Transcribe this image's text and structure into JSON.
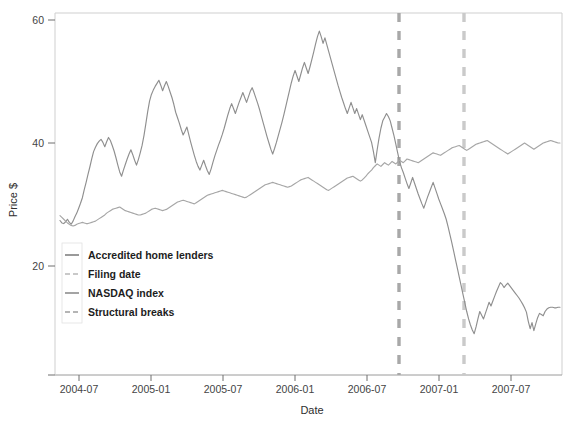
{
  "chart_data": {
    "type": "line",
    "title": "",
    "xlabel": "Date",
    "ylabel": "Price $",
    "grid": false,
    "legend_position": "inner-left",
    "x_tick_labels": [
      "2004-07",
      "2005-01",
      "2005-07",
      "2006-01",
      "2006-07",
      "2007-01",
      "2007-07"
    ],
    "y_tick_labels": [
      "20",
      "40",
      "60"
    ],
    "ylim": [
      0,
      62
    ],
    "xlim": [
      "2004-05-01",
      "2007-11-15"
    ],
    "legend": [
      {
        "label": "Accredited home lenders",
        "color": "#8f8f8f",
        "style": "solid"
      },
      {
        "label": "Filing date",
        "color": "#c9c9c9",
        "style": "dashed"
      },
      {
        "label": "NASDAQ index",
        "color": "#9a9a9a",
        "style": "solid"
      },
      {
        "label": "Structural breaks",
        "color": "#b5b5b5",
        "style": "dashed"
      }
    ],
    "vertical_lines": [
      {
        "name": "structural-break",
        "label": "Structural breaks",
        "x_label": "2006-09",
        "x_px": 399,
        "color": "#a8a8a8",
        "style": "dashed"
      },
      {
        "name": "filing-date",
        "label": "Filing date",
        "x_label": "2007-03",
        "x_px": 464,
        "color": "#cacaca",
        "style": "dashed"
      }
    ],
    "series": [
      {
        "name": "Accredited home lenders",
        "color": "#8f8f8f",
        "values": [
          27.4,
          27.0,
          26.9,
          27.2,
          27.6,
          27.1,
          26.8,
          27.3,
          28.0,
          28.6,
          29.4,
          30.2,
          31.1,
          32.4,
          33.6,
          34.9,
          36.1,
          37.4,
          38.6,
          39.3,
          39.9,
          40.3,
          40.6,
          40.1,
          39.4,
          40.2,
          40.9,
          40.4,
          39.6,
          38.7,
          37.6,
          36.4,
          35.3,
          34.6,
          35.6,
          36.5,
          37.4,
          38.2,
          38.9,
          38.1,
          37.2,
          36.4,
          37.3,
          38.4,
          39.6,
          41.2,
          43.1,
          45.1,
          46.8,
          47.9,
          48.6,
          49.2,
          49.7,
          50.2,
          49.4,
          48.5,
          49.3,
          50.0,
          49.2,
          48.3,
          47.4,
          46.3,
          45.0,
          44.1,
          43.2,
          42.2,
          41.3,
          41.9,
          42.6,
          41.4,
          40.2,
          39.1,
          38.0,
          37.0,
          36.2,
          35.6,
          36.4,
          37.2,
          36.3,
          35.5,
          34.9,
          35.8,
          36.9,
          37.9,
          38.8,
          39.7,
          40.5,
          41.4,
          42.4,
          43.5,
          44.6,
          45.6,
          46.4,
          45.6,
          44.8,
          45.7,
          46.6,
          47.4,
          48.2,
          47.4,
          46.6,
          47.5,
          48.4,
          49.0,
          48.2,
          47.3,
          46.4,
          45.4,
          44.3,
          43.2,
          42.1,
          41.0,
          40.0,
          39.0,
          38.2,
          39.1,
          40.1,
          41.2,
          42.3,
          43.4,
          44.6,
          45.9,
          47.2,
          48.5,
          49.8,
          50.9,
          51.8,
          50.9,
          50.0,
          51.1,
          52.2,
          53.1,
          52.2,
          51.3,
          52.4,
          53.6,
          54.8,
          56.1,
          57.3,
          58.2,
          57.3,
          56.2,
          57.1,
          56.0,
          54.9,
          53.8,
          52.7,
          51.6,
          50.5,
          49.4,
          48.4,
          47.4,
          46.5,
          45.6,
          44.8,
          45.7,
          46.6,
          45.7,
          44.8,
          45.6,
          44.7,
          43.8,
          44.6,
          43.7,
          42.8,
          41.9,
          41.0,
          40.1,
          38.6,
          36.8,
          38.9,
          40.8,
          42.4,
          43.6,
          44.2,
          44.8,
          44.3,
          43.6,
          42.4,
          41.2,
          39.8,
          38.4,
          37.0,
          36.0,
          35.2,
          34.3,
          33.4,
          32.6,
          33.5,
          34.4,
          33.5,
          32.6,
          31.7,
          30.9,
          30.1,
          29.4,
          30.3,
          31.2,
          32.0,
          32.8,
          33.6,
          32.7,
          31.8,
          30.9,
          30.1,
          29.3,
          28.5,
          27.6,
          26.4,
          25.1,
          23.8,
          22.4,
          21.0,
          19.6,
          18.2,
          16.8,
          15.4,
          14.0,
          12.6,
          11.4,
          10.4,
          9.6,
          9.0,
          10.1,
          11.4,
          12.6,
          12.0,
          11.4,
          12.3,
          13.2,
          14.1,
          13.5,
          14.3,
          15.1,
          15.9,
          16.6,
          17.3,
          17.0,
          16.5,
          16.9,
          17.2,
          16.8,
          16.4,
          16.0,
          15.6,
          15.2,
          14.8,
          14.3,
          13.8,
          13.2,
          12.5,
          11.0,
          9.8,
          10.8,
          9.5,
          10.6,
          11.6,
          12.3,
          12.1,
          11.9,
          12.6,
          13.0,
          13.2,
          13.3,
          13.3,
          13.2,
          13.2,
          13.3,
          13.3
        ]
      },
      {
        "name": "NASDAQ index",
        "color": "#a6a6a6",
        "values": [
          28.2,
          27.9,
          27.6,
          27.3,
          27.0,
          26.8,
          26.6,
          26.5,
          26.6,
          26.8,
          26.9,
          27.0,
          27.1,
          27.0,
          26.9,
          26.9,
          27.0,
          27.1,
          27.2,
          27.3,
          27.5,
          27.7,
          27.9,
          28.1,
          28.3,
          28.6,
          28.8,
          29.0,
          29.2,
          29.3,
          29.4,
          29.5,
          29.6,
          29.4,
          29.2,
          29.0,
          28.9,
          28.8,
          28.7,
          28.6,
          28.5,
          28.4,
          28.3,
          28.3,
          28.4,
          28.5,
          28.6,
          28.8,
          29.0,
          29.2,
          29.3,
          29.4,
          29.3,
          29.2,
          29.1,
          29.0,
          29.1,
          29.2,
          29.4,
          29.6,
          29.8,
          30.0,
          30.2,
          30.4,
          30.5,
          30.6,
          30.7,
          30.6,
          30.5,
          30.4,
          30.3,
          30.2,
          30.1,
          30.3,
          30.5,
          30.7,
          30.9,
          31.1,
          31.3,
          31.5,
          31.6,
          31.7,
          31.8,
          31.9,
          32.0,
          32.1,
          32.2,
          32.3,
          32.2,
          32.1,
          32.0,
          31.9,
          31.8,
          31.7,
          31.6,
          31.5,
          31.4,
          31.3,
          31.2,
          31.1,
          31.2,
          31.4,
          31.6,
          31.8,
          32.0,
          32.2,
          32.4,
          32.6,
          32.8,
          33.0,
          33.2,
          33.3,
          33.4,
          33.5,
          33.6,
          33.5,
          33.4,
          33.3,
          33.2,
          33.1,
          33.0,
          32.9,
          32.8,
          32.9,
          33.0,
          33.2,
          33.4,
          33.6,
          33.8,
          34.0,
          34.1,
          34.2,
          34.3,
          34.4,
          34.2,
          34.0,
          33.8,
          33.6,
          33.4,
          33.2,
          33.0,
          32.8,
          32.6,
          32.4,
          32.3,
          32.5,
          32.7,
          32.9,
          33.1,
          33.3,
          33.5,
          33.7,
          33.9,
          34.1,
          34.3,
          34.4,
          34.5,
          34.6,
          34.4,
          34.2,
          34.0,
          33.8,
          34.0,
          34.3,
          34.6,
          35.0,
          35.3,
          35.6,
          36.0,
          36.3,
          36.6,
          36.4,
          36.2,
          36.5,
          36.8,
          36.6,
          36.4,
          36.7,
          37.0,
          36.8,
          36.6,
          36.9,
          37.2,
          37.0,
          36.8,
          37.1,
          37.4,
          37.3,
          37.2,
          37.1,
          37.0,
          36.9,
          36.8,
          37.0,
          37.2,
          37.4,
          37.6,
          37.8,
          38.0,
          38.2,
          38.4,
          38.3,
          38.2,
          38.1,
          38.0,
          38.2,
          38.4,
          38.6,
          38.8,
          39.0,
          39.2,
          39.3,
          39.4,
          39.5,
          39.6,
          39.4,
          39.2,
          39.0,
          38.8,
          39.0,
          39.2,
          39.4,
          39.6,
          39.8,
          39.9,
          40.0,
          40.1,
          40.2,
          40.3,
          40.4,
          40.2,
          40.0,
          39.8,
          39.6,
          39.4,
          39.2,
          39.0,
          38.8,
          38.6,
          38.4,
          38.2,
          38.4,
          38.6,
          38.8,
          39.0,
          39.2,
          39.4,
          39.6,
          39.8,
          40.0,
          39.8,
          39.6,
          39.4,
          39.2,
          39.0,
          39.2,
          39.4,
          39.6,
          39.8,
          40.0,
          40.1,
          40.2,
          40.3,
          40.4,
          40.3,
          40.2,
          40.1,
          40.0,
          40.0
        ]
      }
    ]
  }
}
